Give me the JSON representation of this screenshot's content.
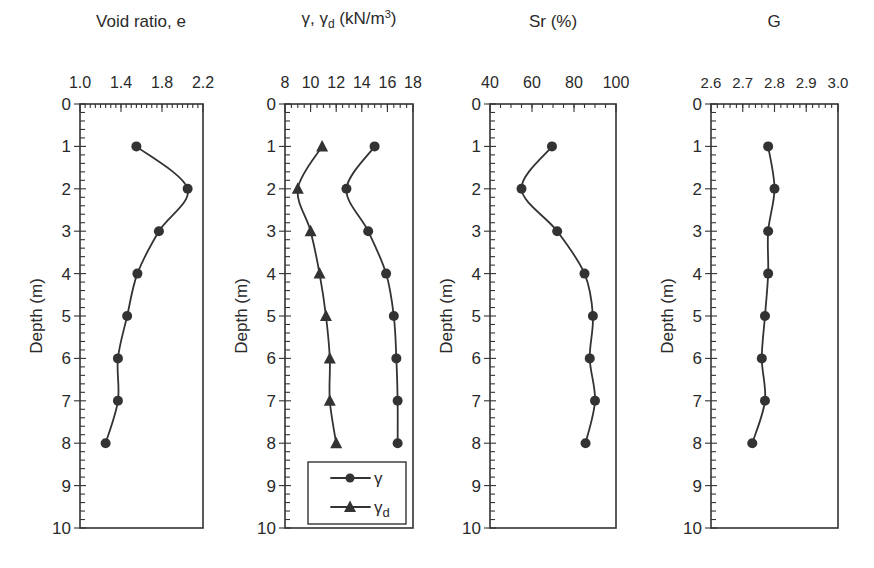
{
  "figure": {
    "depth_axis": {
      "label": "Depth (m)",
      "min": 0,
      "max": 10,
      "ticks": [
        "0",
        "1",
        "2",
        "3",
        "4",
        "5",
        "6",
        "7",
        "8",
        "9",
        "10"
      ]
    }
  },
  "chart_data": [
    {
      "type": "line",
      "title": "Void ratio, e",
      "xlabel": "Void ratio, e",
      "ylabel": "Depth (m)",
      "xlim": [
        1.0,
        2.2
      ],
      "ylim": [
        10,
        0
      ],
      "x_ticks": [
        "1.0",
        "1.4",
        "1.8",
        "2.2"
      ],
      "x_minor_step": 0.05,
      "y_ticks": [
        0,
        1,
        2,
        3,
        4,
        5,
        6,
        7,
        8,
        9,
        10
      ],
      "legend": [],
      "series": [
        {
          "name": "e",
          "marker": "circle",
          "depth": [
            1,
            2,
            3,
            4,
            5,
            6,
            7,
            8
          ],
          "values": [
            1.55,
            2.05,
            1.77,
            1.56,
            1.46,
            1.37,
            1.37,
            1.25
          ]
        }
      ]
    },
    {
      "type": "line",
      "title": "γ, γd (kN/m³)",
      "xlabel": "γ, γd (kN/m³)",
      "ylabel": "Depth (m)",
      "xlim": [
        8,
        18
      ],
      "ylim": [
        10,
        0
      ],
      "x_ticks": [
        "8",
        "10",
        "12",
        "14",
        "16",
        "18"
      ],
      "x_minor_step": 0.5,
      "y_ticks": [
        0,
        1,
        2,
        3,
        4,
        5,
        6,
        7,
        8,
        9,
        10
      ],
      "legend": [
        "γ",
        "γd"
      ],
      "legend_position": "lower right",
      "series": [
        {
          "name": "γ",
          "marker": "circle",
          "depth": [
            1,
            2,
            3,
            4,
            5,
            6,
            7,
            8
          ],
          "values": [
            15.0,
            12.8,
            14.5,
            15.9,
            16.5,
            16.7,
            16.8,
            16.8
          ]
        },
        {
          "name": "γd",
          "marker": "triangle",
          "depth": [
            1,
            2,
            3,
            4,
            5,
            6,
            7,
            8
          ],
          "values": [
            10.9,
            9.0,
            10.0,
            10.7,
            11.2,
            11.5,
            11.5,
            12.0
          ]
        }
      ]
    },
    {
      "type": "line",
      "title": "Sr (%)",
      "xlabel": "Sr (%)",
      "ylabel": "Depth (m)",
      "xlim": [
        40,
        100
      ],
      "ylim": [
        10,
        0
      ],
      "x_ticks": [
        "40",
        "60",
        "80",
        "100"
      ],
      "x_minor_step": 5,
      "y_ticks": [
        0,
        1,
        2,
        3,
        4,
        5,
        6,
        7,
        8,
        9,
        10
      ],
      "legend": [],
      "series": [
        {
          "name": "Sr",
          "marker": "circle",
          "depth": [
            1,
            2,
            3,
            4,
            5,
            6,
            7,
            8
          ],
          "values": [
            69.5,
            55,
            72,
            85,
            89,
            87.5,
            90,
            85.5
          ]
        }
      ]
    },
    {
      "type": "line",
      "title": "G",
      "xlabel": "G",
      "ylabel": "Depth (m)",
      "xlim": [
        2.6,
        3.0
      ],
      "ylim": [
        10,
        0
      ],
      "x_ticks": [
        "2.6",
        "2.7",
        "2.8",
        "2.9",
        "3.0"
      ],
      "x_minor_step": 0.02,
      "y_ticks": [
        0,
        1,
        2,
        3,
        4,
        5,
        6,
        7,
        8,
        9,
        10
      ],
      "legend": [],
      "series": [
        {
          "name": "G",
          "marker": "circle",
          "depth": [
            1,
            2,
            3,
            4,
            5,
            6,
            7,
            8
          ],
          "values": [
            2.78,
            2.8,
            2.78,
            2.78,
            2.77,
            2.76,
            2.77,
            2.73
          ]
        }
      ]
    }
  ]
}
